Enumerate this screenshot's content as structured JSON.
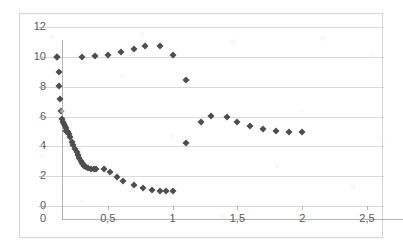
{
  "chart_data": {
    "type": "scatter",
    "title": "",
    "xlabel": "",
    "ylabel": "",
    "xlim": [
      0,
      2.5
    ],
    "ylim": [
      0,
      12
    ],
    "grid": true,
    "legend": "none",
    "marker": "diamond",
    "marker_color": "#4e4e4e",
    "decimal_separator": ",",
    "x_ticks": [
      0,
      0.5,
      1,
      1.5,
      2,
      2.5
    ],
    "x_tick_labels": [
      "0",
      "0,5",
      "1",
      "1,5",
      "2",
      "2,5"
    ],
    "y_ticks": [
      0,
      2,
      4,
      6,
      8,
      10,
      12
    ],
    "y_tick_labels": [
      "0",
      "2",
      "4",
      "6",
      "8",
      "10",
      "12"
    ],
    "series": [
      {
        "name": "series1",
        "points": [
          [
            0.11,
            10.0
          ],
          [
            0.12,
            9.0
          ],
          [
            0.12,
            8.05
          ],
          [
            0.13,
            7.15
          ],
          [
            0.14,
            6.4
          ],
          [
            0.15,
            5.85
          ],
          [
            0.155,
            5.65
          ],
          [
            0.16,
            5.5
          ],
          [
            0.17,
            5.35
          ],
          [
            0.175,
            5.2
          ],
          [
            0.18,
            5.05
          ],
          [
            0.19,
            4.95
          ],
          [
            0.2,
            4.8
          ],
          [
            0.21,
            4.65
          ],
          [
            0.22,
            4.3
          ],
          [
            0.235,
            4.1
          ],
          [
            0.25,
            3.8
          ],
          [
            0.26,
            3.6
          ],
          [
            0.27,
            3.4
          ],
          [
            0.28,
            3.2
          ],
          [
            0.29,
            3.05
          ],
          [
            0.3,
            2.9
          ],
          [
            0.31,
            2.8
          ],
          [
            0.32,
            2.7
          ],
          [
            0.33,
            2.62
          ],
          [
            0.35,
            2.55
          ],
          [
            0.37,
            2.5
          ],
          [
            0.39,
            2.48
          ],
          [
            0.41,
            2.47
          ],
          [
            0.47,
            2.45
          ],
          [
            0.52,
            2.25
          ],
          [
            0.57,
            1.95
          ],
          [
            0.62,
            1.65
          ],
          [
            0.7,
            1.4
          ],
          [
            0.77,
            1.2
          ],
          [
            0.84,
            1.05
          ],
          [
            0.9,
            1.0
          ],
          [
            0.95,
            0.98
          ],
          [
            1.0,
            0.98
          ],
          [
            0.11,
            10.0
          ],
          [
            0.3,
            10.0
          ],
          [
            0.4,
            10.05
          ],
          [
            0.5,
            10.1
          ],
          [
            0.6,
            10.3
          ],
          [
            0.7,
            10.55
          ],
          [
            0.79,
            10.75
          ],
          [
            0.9,
            10.72
          ],
          [
            1.0,
            10.15
          ],
          [
            1.1,
            8.45
          ],
          [
            1.1,
            4.2
          ],
          [
            1.22,
            5.65
          ],
          [
            1.3,
            6.05
          ],
          [
            1.42,
            5.95
          ],
          [
            1.5,
            5.65
          ],
          [
            1.6,
            5.35
          ],
          [
            1.7,
            5.15
          ],
          [
            1.8,
            5.0
          ],
          [
            1.9,
            4.97
          ],
          [
            2.0,
            4.95
          ]
        ]
      }
    ]
  },
  "axis": {
    "y_label_12": "12",
    "y_label_10": "10",
    "y_label_8": "8",
    "y_label_6": "6",
    "y_label_4": "4",
    "y_label_2": "2",
    "y_label_0": "0",
    "x_label_0": "0",
    "x_label_05": "0,5",
    "x_label_1": "1",
    "x_label_15": "1,5",
    "x_label_2": "2",
    "x_label_25": "2,5"
  }
}
